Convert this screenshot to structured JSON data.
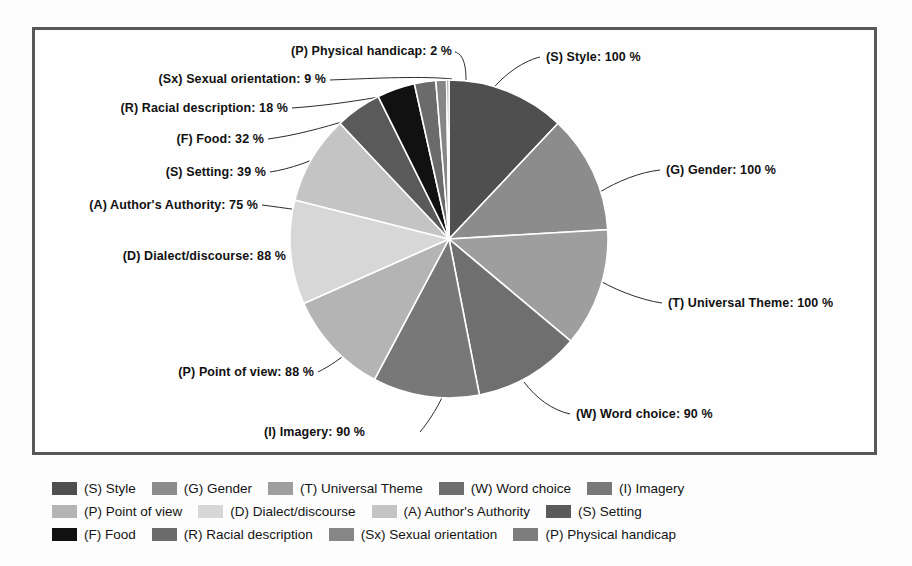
{
  "chart_data": {
    "type": "pie",
    "title": "",
    "unit": "%",
    "start_angle_deg": 0,
    "direction": "clockwise",
    "legend_position": "bottom",
    "categories": [
      "(S) Style",
      "(G) Gender",
      "(T) Universal Theme",
      "(W) Word choice",
      "(I) Imagery",
      "(P) Point of view",
      "(D) Dialect/discourse",
      "(A) Author's Authority",
      "(S) Setting",
      "(F) Food",
      "(R) Racial description",
      "(Sx) Sexual orientation",
      "(P) Physical handicap"
    ],
    "values": [
      100,
      100,
      100,
      90,
      90,
      88,
      88,
      75,
      39,
      32,
      18,
      9,
      2
    ],
    "colors": [
      "#4f4f4f",
      "#8c8c8c",
      "#9e9e9e",
      "#6f6f6f",
      "#787878",
      "#b4b4b4",
      "#d7d7d7",
      "#c4c4c4",
      "#5a5a5a",
      "#111111",
      "#6b6b6b",
      "#868686",
      "#7d7d7d"
    ],
    "slice_labels": [
      "(S) Style: 100 %",
      "(G) Gender: 100 %",
      "(T) Universal Theme: 100 %",
      "(W) Word choice: 90 %",
      "(I) Imagery: 90 %",
      "(P) Point of view: 88 %",
      "(D) Dialect/discourse: 88 %",
      "(A) Author's Authority: 75 %",
      "(S) Setting: 39 %",
      "(F) Food: 32 %",
      "(R) Racial description: 18 %",
      "(Sx) Sexual orientation: 9 %",
      "(P) Physical handicap: 2 %"
    ]
  },
  "callouts": {
    "style": "(S) Style: 100 %",
    "gender": "(G) Gender: 100 %",
    "universal_theme": "(T) Universal Theme: 100 %",
    "word_choice": "(W) Word choice: 90 %",
    "imagery": "(I) Imagery: 90 %",
    "point_of_view": "(P) Point of view: 88 %",
    "dialect_discourse": "(D) Dialect/discourse: 88 %",
    "authors_authority": "(A) Author's Authority: 75 %",
    "setting": "(S) Setting: 39 %",
    "food": "(F) Food: 32 %",
    "racial_description": "(R) Racial description: 18 %",
    "sexual_orientation": "(Sx) Sexual orientation: 9 %",
    "physical_handicap": "(P) Physical handicap: 2 %"
  },
  "legend": {
    "rows": [
      [
        {
          "label": "(S) Style",
          "color": "#4f4f4f"
        },
        {
          "label": "(G) Gender",
          "color": "#8c8c8c"
        },
        {
          "label": "(T) Universal Theme",
          "color": "#9e9e9e"
        },
        {
          "label": "(W) Word choice",
          "color": "#6f6f6f"
        },
        {
          "label": "(I) Imagery",
          "color": "#787878"
        }
      ],
      [
        {
          "label": "(P) Point of view",
          "color": "#b4b4b4"
        },
        {
          "label": "(D) Dialect/discourse",
          "color": "#d7d7d7"
        },
        {
          "label": "(A) Author's Authority",
          "color": "#c4c4c4"
        },
        {
          "label": "(S) Setting",
          "color": "#5a5a5a"
        }
      ],
      [
        {
          "label": "(F) Food",
          "color": "#111111"
        },
        {
          "label": "(R) Racial description",
          "color": "#6b6b6b"
        },
        {
          "label": "(Sx) Sexual orientation",
          "color": "#868686"
        },
        {
          "label": "(P) Physical handicap",
          "color": "#7d7d7d"
        }
      ]
    ]
  }
}
